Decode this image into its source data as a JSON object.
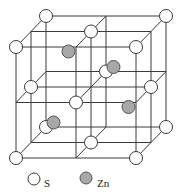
{
  "diagram": {
    "type": "zinc blende unit cell",
    "colors": {
      "line": "#3a3a3a",
      "s_fill": "#ffffff",
      "zn_fill": "#a8a8a8"
    },
    "s_atoms": [
      [
        0,
        0,
        0
      ],
      [
        2,
        0,
        0
      ],
      [
        0,
        2,
        0
      ],
      [
        2,
        2,
        0
      ],
      [
        0,
        0,
        2
      ],
      [
        2,
        0,
        2
      ],
      [
        0,
        2,
        2
      ],
      [
        2,
        2,
        2
      ],
      [
        1,
        1,
        0
      ],
      [
        1,
        1,
        2
      ],
      [
        0,
        1,
        1
      ],
      [
        2,
        1,
        1
      ],
      [
        1,
        0,
        1
      ],
      [
        1,
        2,
        1
      ]
    ],
    "zn_atoms": [
      [
        0.5,
        1.5,
        1.5
      ],
      [
        1.5,
        1.5,
        0.5
      ],
      [
        1.5,
        0.5,
        1.5
      ],
      [
        0.5,
        0.5,
        0.5
      ]
    ]
  },
  "legend": {
    "items": [
      {
        "symbol": "white-circle",
        "label": "S"
      },
      {
        "symbol": "gray-circle",
        "label": "Zn"
      }
    ]
  }
}
